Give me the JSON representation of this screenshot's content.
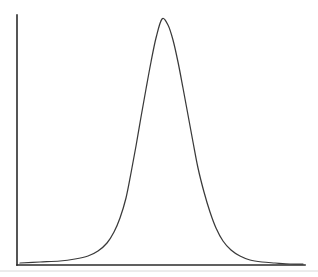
{
  "figure": {
    "name": "probability-density-curve",
    "width": 318,
    "height": 277,
    "background_color": "#ffffff",
    "title": "",
    "subtitle": "",
    "caption": ""
  },
  "style": {
    "axis_color": "#2b2b2b",
    "curve_color": "#3a3a3a",
    "footer_rule_color": "#d8d8d8",
    "axis_stroke_width": 1.6,
    "curve_stroke_width": 1.25
  },
  "axes": {
    "y_axis": {
      "name": "y-axis",
      "label": "",
      "visible": true,
      "x_px": 17,
      "y_top_px": 15,
      "y_bottom_px": 265,
      "ticks": [],
      "tick_labels": []
    },
    "x_axis": {
      "name": "x-axis",
      "label": "",
      "visible": true,
      "y_px": 265,
      "x_left_px": 17,
      "x_right_px": 305,
      "ticks": [],
      "tick_labels": []
    },
    "grid": false,
    "legend": null
  },
  "footer_rule": {
    "name": "footer-separator-rule",
    "visible": true,
    "y_px": 271,
    "x_left_px": 0,
    "x_right_px": 318
  },
  "chart_data": {
    "type": "line",
    "title": "",
    "subtitle": "",
    "xlabel": "",
    "ylabel": "",
    "grid": false,
    "legend": null,
    "annotations": [],
    "distribution_shape": "leptokurtic bell curve (sharp peak, heavy tails)",
    "xlim": [
      0,
      1
    ],
    "ylim": [
      0,
      1
    ],
    "peak": {
      "x": 0.503,
      "y": 1.0
    },
    "baseline_y": 0.0,
    "half_maximum_width_x": 0.235,
    "series": [
      {
        "name": "density",
        "color": "#3a3a3a",
        "x": [
          0.0,
          0.04,
          0.08,
          0.12,
          0.16,
          0.2,
          0.24,
          0.28,
          0.3,
          0.32,
          0.34,
          0.36,
          0.38,
          0.4,
          0.42,
          0.44,
          0.46,
          0.48,
          0.503,
          0.52,
          0.54,
          0.56,
          0.58,
          0.6,
          0.62,
          0.64,
          0.66,
          0.68,
          0.7,
          0.72,
          0.76,
          0.8,
          0.84,
          0.88,
          0.92,
          0.96,
          1.0
        ],
        "y": [
          0.004,
          0.005,
          0.007,
          0.01,
          0.015,
          0.024,
          0.042,
          0.086,
          0.128,
          0.192,
          0.285,
          0.405,
          0.545,
          0.69,
          0.82,
          0.918,
          0.975,
          0.998,
          1.0,
          0.994,
          0.968,
          0.915,
          0.835,
          0.732,
          0.617,
          0.5,
          0.392,
          0.299,
          0.223,
          0.165,
          0.09,
          0.05,
          0.029,
          0.018,
          0.011,
          0.007,
          0.005
        ]
      }
    ]
  },
  "pixel_geometry": {
    "note": "Curve control points in screenshot pixel coordinates (origin top-left).",
    "curve_points_px": [
      [
        20,
        263
      ],
      [
        40,
        262
      ],
      [
        60,
        261
      ],
      [
        75,
        259
      ],
      [
        88,
        256
      ],
      [
        98,
        251
      ],
      [
        107,
        243
      ],
      [
        114,
        232
      ],
      [
        120,
        218
      ],
      [
        126,
        198
      ],
      [
        131,
        173
      ],
      [
        136,
        146
      ],
      [
        141,
        117
      ],
      [
        146,
        89
      ],
      [
        151,
        62
      ],
      [
        156,
        38
      ],
      [
        162,
        19
      ],
      [
        168,
        25
      ],
      [
        173,
        40
      ],
      [
        178,
        62
      ],
      [
        183,
        88
      ],
      [
        188,
        115
      ],
      [
        193,
        142
      ],
      [
        198,
        168
      ],
      [
        204,
        192
      ],
      [
        210,
        212
      ],
      [
        216,
        228
      ],
      [
        223,
        241
      ],
      [
        231,
        250
      ],
      [
        240,
        256
      ],
      [
        250,
        260
      ],
      [
        262,
        262
      ],
      [
        275,
        263
      ],
      [
        290,
        264
      ],
      [
        303,
        264
      ]
    ]
  }
}
